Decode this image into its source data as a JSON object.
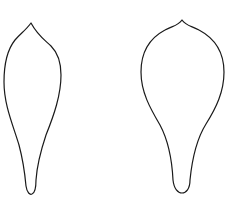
{
  "figure": {
    "background": "#ffffff",
    "stroke_color": "#1a1a1a",
    "shapes": [
      {
        "name": "narrow-petal-outline",
        "description": "elongated leaf/petal shape with pointed tip and narrow stalk"
      },
      {
        "name": "wide-petal-outline",
        "description": "rounded leaf/petal shape with small pointed tip and narrow stalk"
      }
    ]
  }
}
